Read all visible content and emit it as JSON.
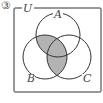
{
  "problem_number": "③",
  "universe_label": "U",
  "sets": [
    {
      "label": "A"
    },
    {
      "label": "B"
    },
    {
      "label": "C"
    }
  ],
  "shaded_regions": [
    "A∩B",
    "B∩C"
  ],
  "colors": {
    "shade": "#b3b3b3",
    "stroke": "#333333"
  }
}
